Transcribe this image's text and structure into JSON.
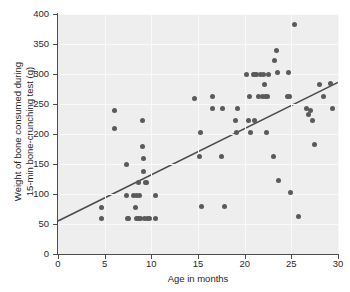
{
  "chart_data": {
    "type": "scatter",
    "title": "",
    "xlabel": "Age in months",
    "ylabel": "Weight of bone consumed during\n15-min bone-crunching test (g)",
    "ylabel_line1": "Weight of bone consumed during",
    "ylabel_line2": "15-min bone-crunching test (g)",
    "xlim": [
      0,
      30
    ],
    "ylim": [
      0,
      400
    ],
    "xticks": [
      0,
      5,
      10,
      15,
      20,
      25,
      30
    ],
    "yticks": [
      0,
      50,
      100,
      150,
      200,
      250,
      300,
      350,
      400
    ],
    "xtick_labels": [
      "0",
      "5",
      "10",
      "15",
      "20",
      "25",
      "30"
    ],
    "ytick_labels": [
      "0",
      "50",
      "100",
      "150",
      "200",
      "250",
      "300",
      "350",
      "400"
    ],
    "grid": true,
    "grid_color": "#fafafa",
    "plot_bgcolor": "#eeeeee",
    "marker_color": "#5a5a5a",
    "marker_size": 5,
    "legend": null,
    "trendline": {
      "label": "least-squares regression line",
      "color": "#4a4a4a",
      "x_start": 0,
      "y_start": 55,
      "x_end": 30,
      "y_end": 286,
      "slope": 7.7,
      "intercept": 55
    },
    "x": [
      4.7,
      4.7,
      6.1,
      6.1,
      7.3,
      7.3,
      7.4,
      7.6,
      8.1,
      8.3,
      8.4,
      8.4,
      8.6,
      8.6,
      8.7,
      8.8,
      9.0,
      9.1,
      9.2,
      9.2,
      9.3,
      9.4,
      9.5,
      9.6,
      9.8,
      10.4,
      10.4,
      14.6,
      15.2,
      15.3,
      15.4,
      16.5,
      16.6,
      17.5,
      17.6,
      17.8,
      19.0,
      19.1,
      19.2,
      20.2,
      20.4,
      20.5,
      20.6,
      20.9,
      21.0,
      21.1,
      21.3,
      21.5,
      21.7,
      21.9,
      22.0,
      22.1,
      22.2,
      22.3,
      22.4,
      22.5,
      23.1,
      23.2,
      23.4,
      23.5,
      23.6,
      24.6,
      24.7,
      24.8,
      24.9,
      25.3,
      25.8,
      26.6,
      26.8,
      27.1,
      27.3,
      27.5,
      28.0,
      28.4,
      29.2,
      29.4
    ],
    "y": [
      77,
      59,
      240,
      210,
      150,
      98,
      59,
      59,
      98,
      78,
      98,
      59,
      120,
      59,
      98,
      59,
      222,
      180,
      160,
      138,
      59,
      120,
      120,
      59,
      59,
      98,
      59,
      260,
      162,
      202,
      80,
      242,
      262,
      162,
      242,
      80,
      222,
      202,
      242,
      300,
      222,
      262,
      202,
      300,
      222,
      300,
      300,
      262,
      300,
      262,
      300,
      282,
      262,
      202,
      262,
      300,
      162,
      322,
      340,
      302,
      122,
      262,
      302,
      262,
      102,
      382,
      62,
      242,
      232,
      240,
      222,
      182,
      282,
      262,
      284,
      242
    ]
  }
}
